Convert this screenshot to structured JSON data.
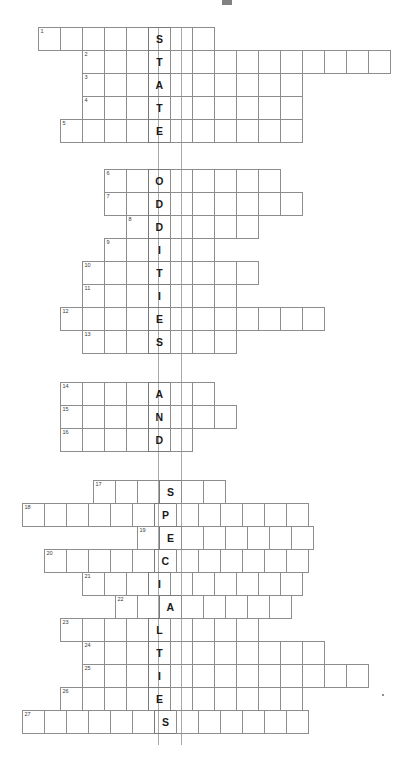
{
  "puzzle": {
    "title_mark": "",
    "keyword": "STATEODDITIESANDSPECIALTIES",
    "key_column_index": 0,
    "cell_size": 23,
    "row_height": 24,
    "key_column_left": 158,
    "blocks": [
      {
        "name": "state",
        "phrase": "STATE",
        "rows": [
          {
            "number": "1",
            "left": 38,
            "top": 27,
            "cells": 8,
            "key_index": 5,
            "letter": "S"
          },
          {
            "number": "2",
            "left": 82,
            "top": 50,
            "cells": 14,
            "key_index": 3,
            "letter": "T"
          },
          {
            "number": "3",
            "left": 82,
            "top": 73,
            "cells": 10,
            "key_index": 3,
            "letter": "A"
          },
          {
            "number": "4",
            "left": 82,
            "top": 96,
            "cells": 10,
            "key_index": 3,
            "letter": "T"
          },
          {
            "number": "5",
            "left": 60,
            "top": 119,
            "cells": 11,
            "key_index": 4,
            "letter": "E"
          }
        ]
      },
      {
        "name": "oddities",
        "phrase": "ODDITIES",
        "rows": [
          {
            "number": "6",
            "top": 169,
            "left": 104,
            "cells": 8,
            "key_index": 2,
            "letter": "O"
          },
          {
            "number": "7",
            "top": 192,
            "left": 104,
            "cells": 9,
            "key_index": 2,
            "letter": "D"
          },
          {
            "number": "8",
            "top": 215,
            "left": 126,
            "cells": 6,
            "key_index": 1,
            "letter": "D"
          },
          {
            "number": "9",
            "top": 238,
            "left": 104,
            "cells": 5,
            "key_index": 2,
            "letter": "I"
          },
          {
            "number": "10",
            "top": 261,
            "left": 82,
            "cells": 8,
            "key_index": 3,
            "letter": "T"
          },
          {
            "number": "11",
            "top": 284,
            "left": 82,
            "cells": 7,
            "key_index": 3,
            "letter": "I"
          },
          {
            "number": "12",
            "top": 307,
            "left": 60,
            "cells": 12,
            "key_index": 4,
            "letter": "E"
          },
          {
            "number": "13",
            "top": 330,
            "left": 82,
            "cells": 7,
            "key_index": 3,
            "letter": "S"
          }
        ]
      },
      {
        "name": "and",
        "phrase": "AND",
        "rows": [
          {
            "number": "14",
            "top": 382,
            "left": 60,
            "cells": 7,
            "key_index": 4,
            "letter": "A"
          },
          {
            "number": "15",
            "top": 405,
            "left": 60,
            "cells": 8,
            "key_index": 4,
            "letter": "N"
          },
          {
            "number": "16",
            "top": 428,
            "left": 60,
            "cells": 6,
            "key_index": 4,
            "letter": "D"
          }
        ]
      },
      {
        "name": "specialties",
        "phrase": "SPECIALTIES",
        "rows": [
          {
            "number": "17",
            "top": 480,
            "left": 93,
            "cells": 6,
            "key_index": 3,
            "letter": "S"
          },
          {
            "number": "18",
            "top": 503,
            "left": 22,
            "cells": 13,
            "key_index": 6,
            "letter": "P"
          },
          {
            "number": "19",
            "top": 526,
            "left": 137,
            "cells": 8,
            "key_index": 1,
            "letter": "E"
          },
          {
            "number": "20",
            "top": 549,
            "left": 44,
            "cells": 12,
            "key_index": 5,
            "letter": "C"
          },
          {
            "number": "21",
            "top": 572,
            "left": 82,
            "cells": 10,
            "key_index": 3,
            "letter": "I"
          },
          {
            "number": "22",
            "top": 595,
            "left": 115,
            "cells": 8,
            "key_index": 2,
            "letter": "A"
          },
          {
            "number": "23",
            "top": 618,
            "left": 60,
            "cells": 9,
            "key_index": 4,
            "letter": "L"
          },
          {
            "number": "24",
            "top": 641,
            "left": 82,
            "cells": 11,
            "key_index": 3,
            "letter": "T"
          },
          {
            "number": "25",
            "top": 664,
            "left": 82,
            "cells": 13,
            "key_index": 3,
            "letter": "I"
          },
          {
            "number": "26",
            "top": 687,
            "left": 60,
            "cells": 11,
            "key_index": 4,
            "letter": "E"
          },
          {
            "number": "27",
            "top": 710,
            "left": 22,
            "cells": 13,
            "key_index": 6,
            "letter": "S"
          }
        ]
      }
    ],
    "guides": [
      {
        "x": 158,
        "top": 27,
        "height": 718
      },
      {
        "x": 181,
        "top": 27,
        "height": 718
      }
    ]
  }
}
